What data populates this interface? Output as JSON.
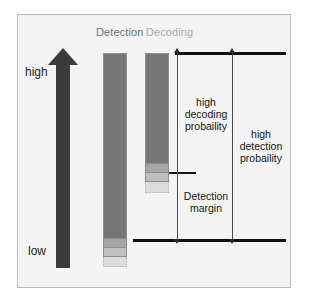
{
  "figure": {
    "background_color": "#f4f4f4",
    "frame_border_color": "#b9b9b9"
  },
  "titles": {
    "detection": "Detection",
    "decoding": "Decoding",
    "detection_color": "#6e6e6e",
    "decoding_color": "#a8a8a8"
  },
  "axis": {
    "high_label": "high",
    "low_label": "low",
    "arrow_direction": "up",
    "arrow_color": "#3b3b3b"
  },
  "bars": [
    {
      "name": "detection-bar",
      "segments": [
        {
          "name": "solid-signal",
          "color": "#767676"
        },
        {
          "name": "mid-band",
          "color": "#a6a6a6"
        },
        {
          "name": "lower-band",
          "color": "#c0c0c0"
        },
        {
          "name": "faint-tail",
          "color": "#dcdcdc"
        }
      ]
    },
    {
      "name": "decoding-bar",
      "segments": [
        {
          "name": "solid-signal",
          "color": "#767676"
        },
        {
          "name": "mid-band",
          "color": "#a6a6a6"
        },
        {
          "name": "lower-band",
          "color": "#c0c0c0"
        },
        {
          "name": "faint-tail",
          "color": "#dcdcdc"
        }
      ]
    }
  ],
  "annotations": {
    "decoding_probability": "high\ndecoding\nprobaility",
    "detection_margin": "Detection\nmargin",
    "detection_probability": "high\ndetection\nprobaility"
  },
  "rules": {
    "top": "upper-reference-line",
    "bottom": "lower-reference-line",
    "middle": "detection-threshold-tick"
  },
  "chart_data": {
    "type": "bar",
    "categories": [
      "Detection",
      "Decoding"
    ],
    "series": [
      {
        "name": "solid-signal",
        "values": [
          186,
          111
        ]
      },
      {
        "name": "mid-band",
        "values": [
          9,
          9
        ]
      },
      {
        "name": "lower-band",
        "values": [
          9,
          9
        ]
      },
      {
        "name": "faint-tail",
        "values": [
          10,
          11
        ]
      }
    ],
    "xlabel": "",
    "ylabel": "",
    "ylim": [
      0,
      214
    ],
    "grid": false,
    "legend": "none",
    "annotations": [
      "high decoding probaility",
      "Detection margin",
      "high detection probaility"
    ]
  }
}
